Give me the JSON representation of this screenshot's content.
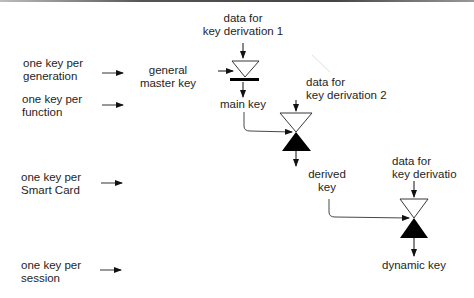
{
  "diagram": {
    "type": "key-derivation-hierarchy",
    "levels": [
      {
        "line1": "one key per",
        "line2": "generation"
      },
      {
        "line1": "one key per",
        "line2": "function"
      },
      {
        "line1": "one key per",
        "line2": "Smart Card"
      },
      {
        "line1": "one key per",
        "line2": "session"
      }
    ],
    "nodes": {
      "general_master_key": {
        "line1": "general",
        "line2": "master  key"
      },
      "main_key": {
        "label": "main key"
      },
      "derived_key": {
        "line1": "derived",
        "line2": "key"
      },
      "dynamic_key": {
        "label": "dynamic key"
      }
    },
    "inputs": [
      {
        "line1": "data for",
        "line2": "key derivation 1"
      },
      {
        "line1": "data for",
        "line2": "key derivation 2"
      },
      {
        "line1": "data for",
        "line2": "key derivatio"
      }
    ],
    "colors": {
      "line": "#1a1a1a",
      "fill_dark": "#000000",
      "fill_light": "#ffffff",
      "top_border": "#4a4a4a"
    }
  }
}
